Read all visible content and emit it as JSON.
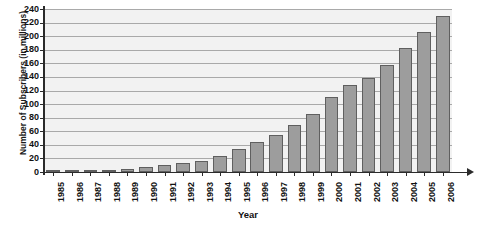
{
  "chart_data": {
    "type": "bar",
    "title": "",
    "xlabel": "Year",
    "ylabel": "Number of Subscribers (in millions)",
    "categories": [
      "1985",
      "1986",
      "1987",
      "1988",
      "1989",
      "1990",
      "1991",
      "1992",
      "1993",
      "1994",
      "1995",
      "1996",
      "1997",
      "1998",
      "1999",
      "2000",
      "2001",
      "2002",
      "2003",
      "2004",
      "2005",
      "2006"
    ],
    "values": [
      0.5,
      1,
      2,
      3,
      5,
      8,
      11,
      13,
      16,
      24,
      34,
      44,
      55,
      69,
      86,
      110,
      128,
      138,
      157,
      182,
      206,
      230
    ],
    "ylim": [
      0,
      240
    ],
    "ytick_step": 20,
    "yticks": [
      "0",
      "20",
      "40",
      "60",
      "80",
      "100",
      "120",
      "140",
      "160",
      "180",
      "200",
      "220",
      "240"
    ],
    "grid": true,
    "legend": "none",
    "bar_color": "#9d9d9d",
    "bar_border_color": "#5f5f5f",
    "plot_background": "#f2f2f2",
    "axis_color": "#2b2b2b",
    "gridline_color": "#a9a9a9"
  }
}
